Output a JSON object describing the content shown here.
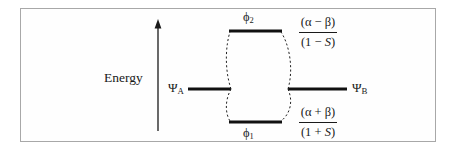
{
  "figure": {
    "kind": "molecular-orbital-energy-level-diagram",
    "axis": {
      "label": "Energy",
      "direction": "up"
    },
    "levels": [
      {
        "id": "antibonding",
        "orbital_label": "ϕ",
        "orbital_subscript": "2",
        "side": "center-top",
        "energy_expression": {
          "numerator": "(α  − β)",
          "denominator": "(1 − S)"
        }
      },
      {
        "id": "atomic-a",
        "orbital_label": "Ψ",
        "orbital_subscript": "A",
        "side": "left"
      },
      {
        "id": "atomic-b",
        "orbital_label": "Ψ",
        "orbital_subscript": "B",
        "side": "right"
      },
      {
        "id": "bonding",
        "orbital_label": "ϕ",
        "orbital_subscript": "1",
        "side": "center-bottom",
        "energy_expression": {
          "numerator": "(α  + β)",
          "denominator": "(1 + S)"
        }
      }
    ],
    "labels": {
      "energy": "Energy",
      "psi_a": "Ψ",
      "psi_a_sub": "A",
      "psi_b": "Ψ",
      "psi_b_sub": "B",
      "phi2": "ϕ",
      "phi2_sub": "2",
      "phi1": "ϕ",
      "phi1_sub": "1",
      "antibonding_numerator": "(α  − β)",
      "antibonding_denominator_open": "(1 − ",
      "antibonding_denominator_var": "S",
      "antibonding_denominator_close": ")",
      "bonding_numerator": "(α  + β)",
      "bonding_denominator_open": "(1 + ",
      "bonding_denominator_var": "S",
      "bonding_denominator_close": ")"
    },
    "colors": {
      "frame_border": "#a8a8a8",
      "level_line": "#111111",
      "correlation_line": "#222222",
      "axis_line": "#1a1a1a",
      "text": "#1a1a1a",
      "background": "#fefefe"
    }
  }
}
